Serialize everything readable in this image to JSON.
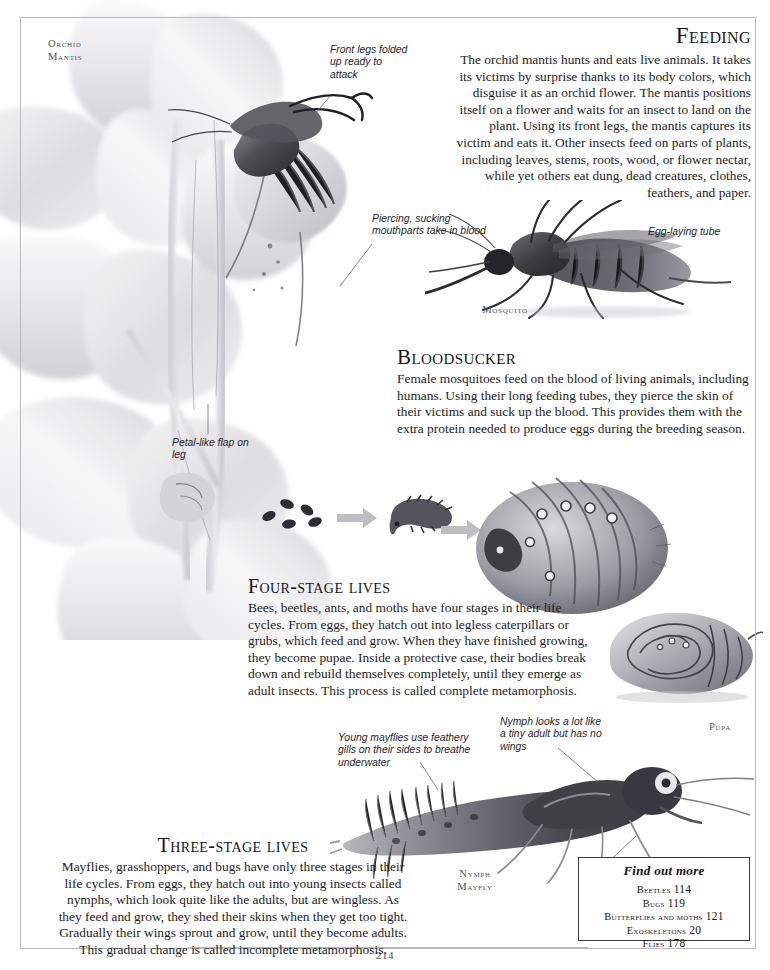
{
  "page": {
    "number": "214",
    "frame_color": "#b9b9bd"
  },
  "sections": [
    {
      "id": "feeding",
      "heading": "Feeding",
      "body": "The orchid mantis hunts and eats live animals. It takes its victims by surprise thanks to its body colors, which disguise it as an orchid flower. The mantis positions itself on a flower and waits for an insect to land on the plant. Using its front legs, the mantis captures its victim and eats it. Other insects feed on parts of plants, including leaves, stems, roots, wood, or flower nectar, while yet others eat dung, dead creatures, clothes, feathers, and paper."
    },
    {
      "id": "bloodsucker",
      "heading": "Bloodsucker",
      "body": "Female mosquitoes feed on the blood of living animals, including humans. Using their long feeding tubes, they pierce the skin of their victims and suck up the blood. This provides them with the extra protein needed to produce eggs during the breeding season."
    },
    {
      "id": "four-stage-lives",
      "heading": "Four-stage lives",
      "body": "Bees, beetles, ants, and moths have four stages in their life cycles. From eggs, they hatch out into legless caterpillars or grubs, which feed and grow. When they have finished growing, they become pupae. Inside a protective case, their bodies break down and rebuild themselves completely, until they emerge as adult insects. This process is called complete metamorphosis."
    },
    {
      "id": "three-stage-lives",
      "heading": "Three-stage lives",
      "body": "Mayflies, grasshoppers, and bugs have only three stages in their life cycles. From eggs, they hatch out into young insects called nymphs, which look quite like the adults, but are wingless. As they feed and grow, they shed their skins when they get too tight. Gradually their wings sprout and grow, until they become adults. This gradual change is called incomplete metamorphosis."
    }
  ],
  "captions": {
    "orchid_mantis": "Orchid\nMantis",
    "orchid_mantis_line1": "Orchid",
    "orchid_mantis_line2": "Mantis",
    "mosquito": "Mosquito",
    "pupa": "Pupa",
    "nymph_line1": "Nymph",
    "nymph_line2": "Mayfly"
  },
  "annotations": {
    "front_legs": "Front legs folded up ready to attack",
    "piercing_mouthparts": "Piercing, sucking mouthparts take in blood",
    "egg_laying_tube": "Egg-laying tube",
    "petal_like_flap": "Petal-like flap on leg",
    "young_mayflies": "Young mayflies use feathery gills on their sides to breathe underwater",
    "nymph_looks": "Nymph looks a lot like a tiny adult but has no wings"
  },
  "find_out_more": {
    "title": "Find out more",
    "entries": [
      {
        "label": "Beetles",
        "page": "114"
      },
      {
        "label": "Bugs",
        "page": "119"
      },
      {
        "label": "Butterflies and moths",
        "page": "121"
      },
      {
        "label": "Exoskeletons",
        "page": "20"
      },
      {
        "label": "Flies",
        "page": "178"
      }
    ]
  },
  "illustrations": [
    {
      "name": "orchid-mantis-photo",
      "alt": "Orchid mantis camouflaged on a pale orchid flower"
    },
    {
      "name": "mosquito-photo",
      "alt": "Mosquito side view"
    },
    {
      "name": "life-cycle-sequence",
      "alt": "Eggs, larva and pupa with arrows"
    },
    {
      "name": "maggot-illustration",
      "alt": "Coiled grub larva"
    },
    {
      "name": "pupa-illustration",
      "alt": "Pupa case"
    },
    {
      "name": "mayfly-nymph-photo",
      "alt": "Mayfly nymph with feathery gills"
    }
  ]
}
